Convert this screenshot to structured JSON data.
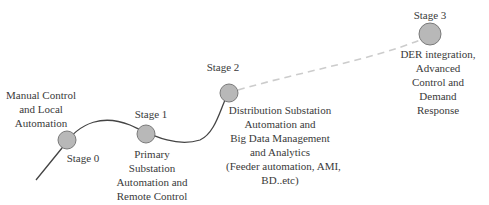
{
  "diagram": {
    "colors": {
      "node_fill": "#b8b8b8",
      "node_stroke": "#7a7a7a",
      "path": "#444444",
      "dashed_path": "#cccccc",
      "text": "#3a3a3a"
    },
    "stages": [
      {
        "title": "Stage 0",
        "description": [
          "Manual Control",
          "and Local",
          "Automation"
        ]
      },
      {
        "title": "Stage 1",
        "description": [
          "Primary",
          "Substation",
          "Automation and",
          "Remote Control"
        ]
      },
      {
        "title": "Stage 2",
        "description": [
          "Distribution Substation",
          "Automation and",
          "Big Data Management",
          "and Analytics",
          "(Feeder automation, AMI,",
          "BD..etc)"
        ]
      },
      {
        "title": "Stage 3",
        "description": [
          "DER integration,",
          "Advanced",
          "Control and",
          "Demand",
          "Response"
        ]
      }
    ]
  }
}
